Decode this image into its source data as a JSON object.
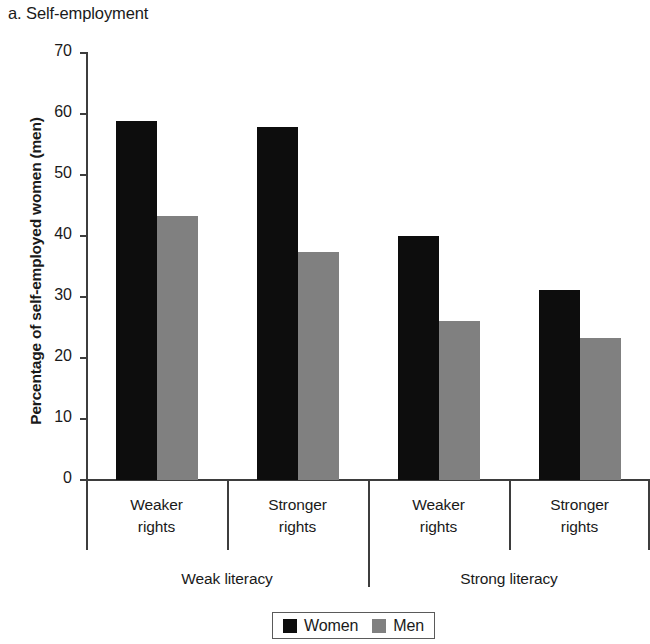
{
  "chart_data": {
    "type": "bar",
    "title": "a. Self-employment",
    "xlabel": "",
    "ylabel": "Percentage of self-employed women (men)",
    "ylim": [
      0,
      70
    ],
    "yticks": [
      0,
      10,
      20,
      30,
      40,
      50,
      60,
      70
    ],
    "ytick_labels": [
      "0",
      "10",
      "20",
      "30",
      "40",
      "50",
      "60",
      "70"
    ],
    "grid": false,
    "legend_position": "bottom-center",
    "categories": [
      "Weaker rights",
      "Stronger rights",
      "Weaker rights",
      "Stronger rights"
    ],
    "category_lines": [
      [
        "Weaker",
        "rights"
      ],
      [
        "Stronger",
        "rights"
      ],
      [
        "Weaker",
        "rights"
      ],
      [
        "Stronger",
        "rights"
      ]
    ],
    "groups": [
      {
        "label": "Weak literacy",
        "categories": [
          "Weaker rights",
          "Stronger rights"
        ]
      },
      {
        "label": "Strong literacy",
        "categories": [
          "Weaker rights",
          "Stronger rights"
        ]
      }
    ],
    "series": [
      {
        "name": "Women",
        "color": "#0d0d0d",
        "values": [
          58.8,
          57.8,
          40.0,
          31.2
        ]
      },
      {
        "name": "Men",
        "color": "#808080",
        "values": [
          43.3,
          37.3,
          26.0,
          23.2
        ]
      }
    ]
  },
  "legend": {
    "items": [
      {
        "label": "Women",
        "color": "#0d0d0d"
      },
      {
        "label": "Men",
        "color": "#808080"
      }
    ]
  }
}
